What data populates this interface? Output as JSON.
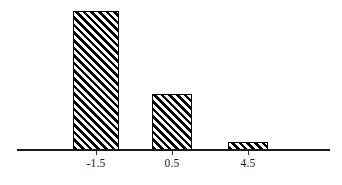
{
  "chart_data": {
    "type": "bar",
    "title": "",
    "subtitle": "",
    "xlabel": "",
    "ylabel": "",
    "categories": [
      "-1.5",
      "0.5",
      "4.5"
    ],
    "values": [
      139,
      56,
      8
    ],
    "values_normalized": [
      1.0,
      0.4,
      0.058
    ],
    "tick_labels": [
      "-1.5",
      "0.5",
      "4.5"
    ],
    "legend": [],
    "legend_position": "none",
    "grid": false,
    "xlim": [
      null,
      null
    ],
    "ylim": [
      0,
      139
    ],
    "y_axis_visible": false,
    "x_axis_visible": true,
    "bar_fill": "diagonal-hatch-45",
    "bar_edge_color": "#000000",
    "bar_fill_color": "#ffffff",
    "hatch_color": "#000000",
    "axis_color": "#1a1a1a",
    "background_color": "#ffffff",
    "annotations": []
  },
  "axis": {
    "name": "x-axis",
    "tick_count": 3
  },
  "bars": [
    {
      "category": "-1.5",
      "value": 139,
      "name": "bar-minus-1-5"
    },
    {
      "category": "0.5",
      "value": 56,
      "name": "bar-0-5"
    },
    {
      "category": "4.5",
      "value": 8,
      "name": "bar-4-5"
    }
  ]
}
